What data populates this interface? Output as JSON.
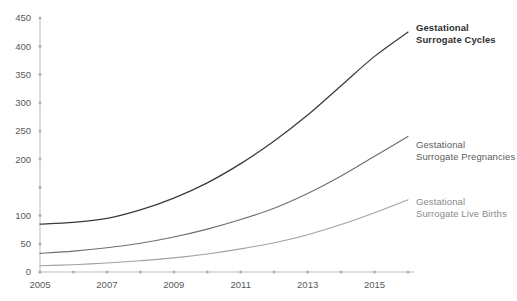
{
  "chart_data": {
    "type": "line",
    "title": "",
    "xlabel": "",
    "ylabel": "",
    "x": [
      2005,
      2006,
      2007,
      2008,
      2009,
      2010,
      2011,
      2012,
      2013,
      2014,
      2015,
      2016
    ],
    "xtick_labels": [
      "2005",
      "2007",
      "2009",
      "2011",
      "2013",
      "2015"
    ],
    "xtick_values": [
      2005,
      2007,
      2009,
      2011,
      2013,
      2015
    ],
    "xlim": [
      2005,
      2016
    ],
    "ytick_labels": [
      "0",
      "50",
      "100",
      "200",
      "250",
      "300",
      "350",
      "400",
      "450"
    ],
    "ytick_values": [
      0,
      50,
      100,
      150,
      200,
      250,
      300,
      350,
      400,
      450
    ],
    "ylim": [
      0,
      450
    ],
    "grid": false,
    "legend_position": "right-inline",
    "series": [
      {
        "name": "Gestational Surrogate Cycles",
        "label_line1": "Gestational",
        "label_line2": "Surrogate Cycles",
        "color": "#3a3a3a",
        "values": [
          85,
          88,
          95,
          110,
          131,
          158,
          192,
          232,
          278,
          330,
          382,
          425
        ]
      },
      {
        "name": "Gestational Surrogate Pregnancies",
        "label_line1": "Gestational",
        "label_line2": "Surrogate Pregnancies",
        "color": "#6e6e6e",
        "values": [
          33,
          37,
          43,
          51,
          62,
          76,
          93,
          113,
          139,
          170,
          205,
          240
        ]
      },
      {
        "name": "Gestational Surrogate Live Births",
        "label_line1": "Gestational",
        "label_line2": "Surrogate Live Births",
        "color": "#a2a2a2",
        "values": [
          11,
          13,
          16,
          20,
          25,
          32,
          41,
          52,
          66,
          84,
          105,
          128
        ]
      }
    ]
  }
}
